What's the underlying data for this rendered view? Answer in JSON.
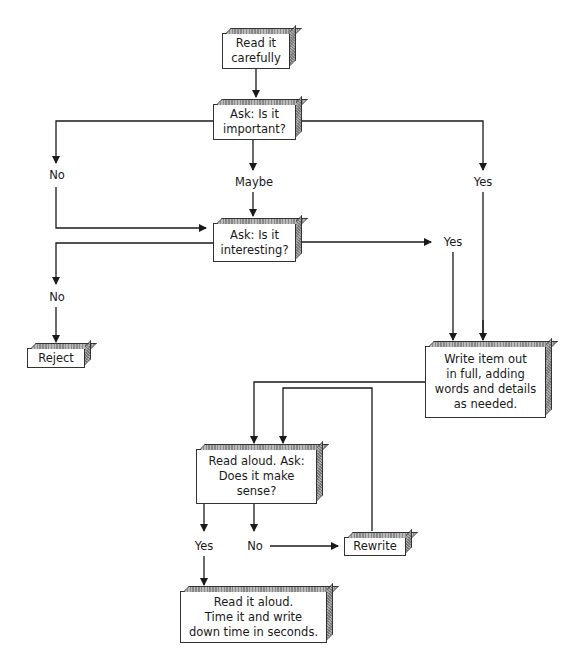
{
  "diagram": {
    "type": "flowchart",
    "nodes": [
      {
        "id": "read_carefully",
        "text": "Read it carefully"
      },
      {
        "id": "important",
        "text": "Ask: Is it important?"
      },
      {
        "id": "interesting",
        "text": "Ask: Is it interesting?"
      },
      {
        "id": "reject",
        "text": "Reject"
      },
      {
        "id": "write_out",
        "text": "Write item out in full, adding words and details as needed."
      },
      {
        "id": "read_aloud_ask",
        "text": "Read aloud. Ask: Does it make sense?"
      },
      {
        "id": "rewrite",
        "text": "Rewrite"
      },
      {
        "id": "time_it",
        "text": "Read it aloud. Time it and write down time in seconds."
      }
    ],
    "edges": [
      {
        "from": "read_carefully",
        "to": "important",
        "label": ""
      },
      {
        "from": "important",
        "to": "interesting",
        "label": "No"
      },
      {
        "from": "important",
        "to": "interesting",
        "label": "Maybe"
      },
      {
        "from": "important",
        "to": "write_out",
        "label": "Yes"
      },
      {
        "from": "interesting",
        "to": "reject",
        "label": "No"
      },
      {
        "from": "interesting",
        "to": "write_out",
        "label": "Yes"
      },
      {
        "from": "write_out",
        "to": "read_aloud_ask",
        "label": ""
      },
      {
        "from": "read_aloud_ask",
        "to": "rewrite",
        "label": "No"
      },
      {
        "from": "rewrite",
        "to": "read_aloud_ask",
        "label": ""
      },
      {
        "from": "read_aloud_ask",
        "to": "time_it",
        "label": "Yes"
      }
    ]
  },
  "labels": {
    "important_no": "No",
    "important_maybe": "Maybe",
    "important_yes": "Yes",
    "interesting_no": "No",
    "interesting_yes": "Yes",
    "sense_yes": "Yes",
    "sense_no": "No"
  },
  "nodes": {
    "read_carefully_l1": "Read it",
    "read_carefully_l2": "carefully",
    "important_l1": "Ask: Is it",
    "important_l2": "important?",
    "interesting_l1": "Ask: Is it",
    "interesting_l2": "interesting?",
    "reject": "Reject",
    "write_l1": "Write item out",
    "write_l2": "in full, adding",
    "write_l3": "words and details",
    "write_l4": "as needed.",
    "sense_l1": "Read aloud. Ask:",
    "sense_l2": "Does it make",
    "sense_l3": "sense?",
    "rewrite": "Rewrite",
    "time_l1": "Read it aloud.",
    "time_l2": "Time it and write",
    "time_l3": "down time in seconds."
  },
  "colors": {
    "line": "#1a1a1a",
    "box_fill": "#ffffff",
    "shade": "#999999"
  }
}
